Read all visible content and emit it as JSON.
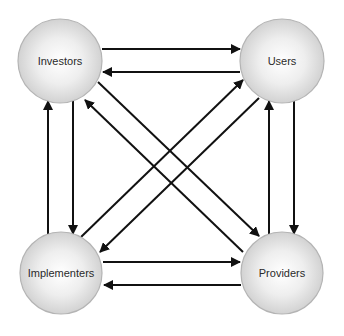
{
  "diagram": {
    "title": "",
    "nodes": [
      {
        "id": "investors",
        "label": "Investors",
        "cx": 60,
        "cy": 61,
        "r": 42
      },
      {
        "id": "users",
        "label": "Users",
        "cx": 282,
        "cy": 61,
        "r": 42
      },
      {
        "id": "implementers",
        "label": "Implementers",
        "cx": 61,
        "cy": 273,
        "r": 41
      },
      {
        "id": "providers",
        "label": "Providers",
        "cx": 282,
        "cy": 273,
        "r": 41
      }
    ],
    "edges": [
      {
        "from": "investors",
        "to": "users",
        "x1": 102,
        "y1": 49,
        "x2": 240,
        "y2": 49
      },
      {
        "from": "users",
        "to": "investors",
        "x1": 240,
        "y1": 72,
        "x2": 103,
        "y2": 72
      },
      {
        "from": "implementers",
        "to": "providers",
        "x1": 103,
        "y1": 262,
        "x2": 240,
        "y2": 262
      },
      {
        "from": "providers",
        "to": "implementers",
        "x1": 241,
        "y1": 285,
        "x2": 104,
        "y2": 285
      },
      {
        "from": "implementers",
        "to": "investors",
        "x1": 48,
        "y1": 234,
        "x2": 48,
        "y2": 101
      },
      {
        "from": "investors",
        "to": "implementers",
        "x1": 73,
        "y1": 101,
        "x2": 73,
        "y2": 234
      },
      {
        "from": "providers",
        "to": "users",
        "x1": 269,
        "y1": 234,
        "x2": 269,
        "y2": 101
      },
      {
        "from": "users",
        "to": "providers",
        "x1": 294,
        "y1": 101,
        "x2": 294,
        "y2": 234
      },
      {
        "from": "investors",
        "to": "providers",
        "x1": 98,
        "y1": 82,
        "x2": 259,
        "y2": 236
      },
      {
        "from": "providers",
        "to": "investors",
        "x1": 243,
        "y1": 252,
        "x2": 85,
        "y2": 100
      },
      {
        "from": "implementers",
        "to": "users",
        "x1": 81,
        "y1": 237,
        "x2": 243,
        "y2": 80
      },
      {
        "from": "users",
        "to": "implementers",
        "x1": 259,
        "y1": 98,
        "x2": 100,
        "y2": 252
      }
    ],
    "colors": {
      "circle_center": "#ffffff",
      "circle_edge": "#d2d2d2",
      "circle_stroke": "#b4b4b4",
      "arrow": "#111111",
      "text": "#2a2a2a"
    }
  }
}
